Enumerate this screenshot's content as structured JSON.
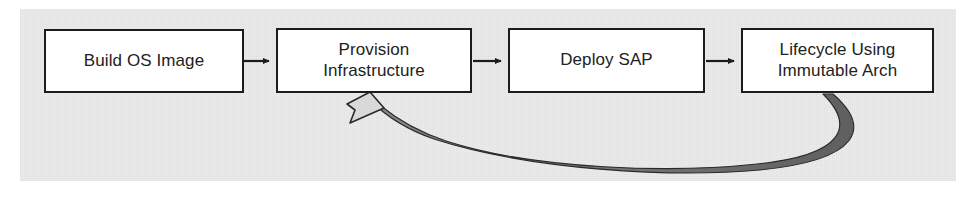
{
  "diagram": {
    "background_color": "#ececec",
    "page_color": "#ffffff",
    "node_fill": "#ffffff",
    "node_stroke": "#1c1c1c",
    "text_color": "#222222",
    "arrow_color": "#1c1c1c",
    "feedback_ribbon_color": "#6e6e6e",
    "feedback_arrowhead_fill": "#d9d9d9",
    "nodes": [
      {
        "id": "build-os-image",
        "label": "Build OS Image"
      },
      {
        "id": "provision-infra",
        "label": "Provision\nInfrastructure"
      },
      {
        "id": "deploy-sap",
        "label": "Deploy SAP"
      },
      {
        "id": "lifecycle",
        "label": "Lifecycle Using\nImmutable Arch"
      }
    ],
    "connectors": [
      {
        "id": "build-to-provision",
        "from": "build-os-image",
        "to": "provision-infra",
        "style": "straight-arrow"
      },
      {
        "id": "provision-to-deploy",
        "from": "provision-infra",
        "to": "deploy-sap",
        "style": "straight-arrow"
      },
      {
        "id": "deploy-to-lifecycle",
        "from": "deploy-sap",
        "to": "lifecycle",
        "style": "straight-arrow"
      },
      {
        "id": "lifecycle-to-provision",
        "from": "lifecycle",
        "to": "provision-infra",
        "style": "curved-feedback-ribbon"
      }
    ]
  }
}
